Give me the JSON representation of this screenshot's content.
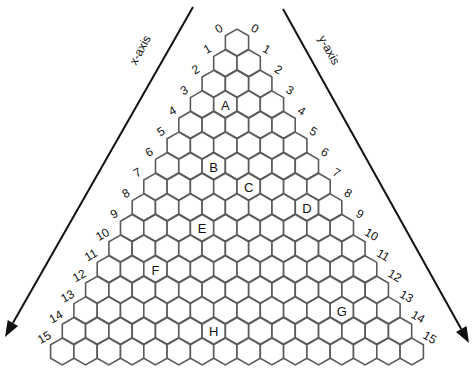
{
  "diagram": {
    "type": "triangular-hexagonal-grid",
    "rows": 16,
    "grid": {
      "top_center_x": 237,
      "top_center_y": 42.5,
      "col_pitch": 23.3,
      "row_pitch": 20.6,
      "hex_radius": 13.4
    },
    "axes": {
      "x_axis": {
        "label": "x-axis",
        "start": [
          193,
          7
        ],
        "end": [
          5,
          337
        ],
        "label_pos": [
          140,
          50
        ],
        "label_rotate": -61
      },
      "y_axis": {
        "label": "y-axis",
        "start": [
          283,
          9
        ],
        "end": [
          469,
          343
        ],
        "label_pos": [
          329,
          50
        ],
        "label_rotate": 61
      }
    },
    "left_numbers": [
      "0",
      "1",
      "2",
      "3",
      "4",
      "5",
      "6",
      "7",
      "8",
      "9",
      "10",
      "11",
      "12",
      "13",
      "14",
      "15"
    ],
    "right_numbers": [
      "0",
      "1",
      "2",
      "3",
      "4",
      "5",
      "6",
      "7",
      "8",
      "9",
      "10",
      "11",
      "12",
      "13",
      "14",
      "15"
    ],
    "markers": [
      {
        "label": "A",
        "row": 3,
        "col": 1
      },
      {
        "label": "B",
        "row": 6,
        "col": 2
      },
      {
        "label": "C",
        "row": 7,
        "col": 4
      },
      {
        "label": "D",
        "row": 8,
        "col": 7
      },
      {
        "label": "E",
        "row": 9,
        "col": 3
      },
      {
        "label": "F",
        "row": 11,
        "col": 2
      },
      {
        "label": "G",
        "row": 13,
        "col": 11
      },
      {
        "label": "H",
        "row": 14,
        "col": 6
      }
    ],
    "colors": {
      "hex_stroke": "#5a5a5a",
      "ink": "#111111",
      "background": "#ffffff"
    }
  }
}
